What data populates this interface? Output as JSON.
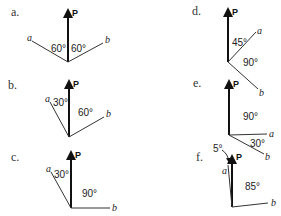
{
  "diagrams": [
    {
      "label": "a.",
      "p": "P",
      "a": "a",
      "b": "b",
      "angles": [
        "60°",
        "60°"
      ]
    },
    {
      "label": "b.",
      "p": "P",
      "a": "a",
      "b": "b",
      "angles": [
        "30°",
        "60°"
      ]
    },
    {
      "label": "c.",
      "p": "P",
      "a": "a",
      "b": "b",
      "angles": [
        "30°",
        "90°"
      ]
    },
    {
      "label": "d.",
      "p": "P",
      "a": "a",
      "b": "b",
      "angles": [
        "45°",
        "90°"
      ]
    },
    {
      "label": "e.",
      "p": "P",
      "a": "a",
      "b": "b",
      "angles": [
        "90°",
        "30°"
      ]
    },
    {
      "label": "f.",
      "p": "P",
      "a": "a",
      "b": "b",
      "angles": [
        "5°",
        "85°"
      ]
    }
  ]
}
